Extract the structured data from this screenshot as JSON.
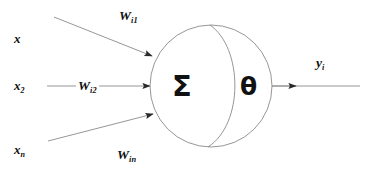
{
  "figure": {
    "type": "diagram",
    "background_color": "#ffffff",
    "stroke_color": "#7a7a7a",
    "text_color": "#111111",
    "width": 370,
    "height": 177
  },
  "inputs": [
    {
      "id": "x1",
      "base": "x",
      "subscript": "",
      "x": 14,
      "y": 32
    },
    {
      "id": "x2",
      "base": "x",
      "subscript": "2",
      "x": 14,
      "y": 79
    },
    {
      "id": "xn",
      "base": "x",
      "subscript": "n",
      "x": 14,
      "y": 143
    }
  ],
  "weights": [
    {
      "id": "wi1",
      "base": "W",
      "subscript": "i1",
      "x": 119,
      "y": 9
    },
    {
      "id": "wi2",
      "base": "W",
      "subscript": "i2",
      "x": 76,
      "y": 79
    },
    {
      "id": "win",
      "base": "W",
      "subscript": "in",
      "x": 117,
      "y": 148
    }
  ],
  "node": {
    "sum_symbol": "Σ",
    "threshold_symbol": "θ",
    "sum_x": 172,
    "sum_y": 72,
    "theta_x": 240,
    "theta_y": 74,
    "circle_cx": 211,
    "circle_cy": 86,
    "circle_r": 61
  },
  "output": {
    "id": "yi",
    "base": "y",
    "subscript": "i",
    "x": 316,
    "y": 56
  },
  "edges": [
    {
      "id": "edge-top",
      "from": "x1",
      "to": "node",
      "x1": 54,
      "y1": 17,
      "x2": 155,
      "y2": 57,
      "arrow": true
    },
    {
      "id": "edge-middle",
      "from": "x2",
      "to": "node",
      "x1": 47,
      "y1": 86,
      "x2": 152,
      "y2": 86,
      "arrow": true
    },
    {
      "id": "edge-bottom",
      "from": "xn",
      "to": "node",
      "x1": 48,
      "y1": 141,
      "x2": 156,
      "y2": 113,
      "arrow": true
    },
    {
      "id": "edge-output",
      "from": "node",
      "to": "yi",
      "x1": 272,
      "y1": 86,
      "x2": 360,
      "y2": 86,
      "arrow": true
    }
  ]
}
